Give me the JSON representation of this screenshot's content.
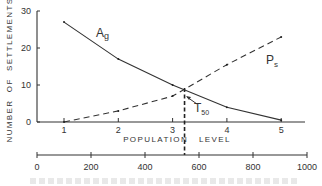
{
  "chart_data": {
    "type": "line",
    "title": "",
    "xlabel": "POPULATION LEVEL",
    "ylabel": "NUMBER OF SETTLEMENTS",
    "x": [
      1,
      2,
      3,
      4,
      5
    ],
    "xlim": [
      0.5,
      5.5
    ],
    "ylim": [
      0,
      30
    ],
    "y_ticks": [
      "0",
      "10",
      "20",
      "30"
    ],
    "x_ticks": [
      "1",
      "2",
      "3",
      "4",
      "5"
    ],
    "series": [
      {
        "name": "Ag",
        "style": "solid",
        "values": [
          27,
          17,
          10,
          4,
          0.5
        ]
      },
      {
        "name": "Ps",
        "style": "dashed",
        "values": [
          0,
          3,
          7,
          15.5,
          23
        ]
      }
    ],
    "annotations": [
      {
        "label": "T",
        "subscript": "50",
        "x": 3.22,
        "note": "crossover threshold marked by vertical dashed line"
      }
    ],
    "secondary_x_axis": {
      "range": [
        0,
        1000
      ],
      "ticks": [
        "0",
        "200",
        "400",
        "600",
        "800",
        "1000"
      ]
    },
    "grid": false,
    "legend": "inline labels"
  },
  "labels": {
    "ag_main": "A",
    "ag_sub": "g",
    "ps_main": "P",
    "ps_sub": "s",
    "t_main": "T",
    "t_sub": "50",
    "xlabel": "POPULATION   LEVEL",
    "ylabel": "NUMBER  OF  SETTLEMENTS"
  }
}
